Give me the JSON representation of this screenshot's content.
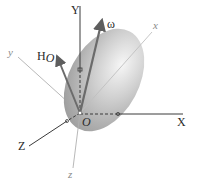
{
  "figure": {
    "origin_label": "O",
    "fixed_axes": [
      {
        "name": "Y",
        "label": "Y"
      },
      {
        "name": "X",
        "label": "X"
      },
      {
        "name": "Z",
        "label": "Z"
      }
    ],
    "body_axes": [
      {
        "name": "x",
        "label": "x"
      },
      {
        "name": "y",
        "label": "y"
      },
      {
        "name": "z",
        "label": "z"
      }
    ],
    "vectors": [
      {
        "name": "omega",
        "label": "ω"
      },
      {
        "name": "angular-momentum",
        "label": "H",
        "subscript": "O"
      }
    ],
    "colors": {
      "fixed_axis": "#3a3a3a",
      "body_axis": "#a8a8a8",
      "vector": "#6b6b6b",
      "body_fill_light": "#f4f4f4",
      "body_fill_dark": "#9a9a9a"
    }
  }
}
